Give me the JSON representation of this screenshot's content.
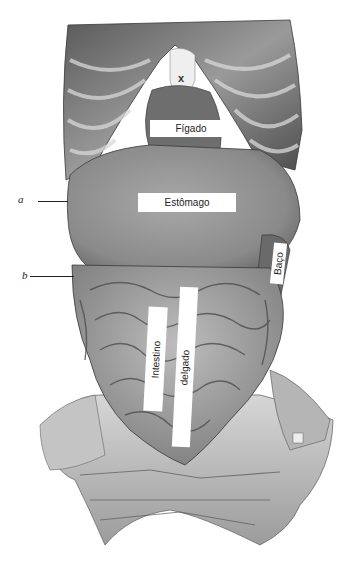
{
  "figure": {
    "style": "grayscale-anatomical-illustration"
  },
  "labels": {
    "figado": "Fígado",
    "estomago": "Estômago",
    "baco": "Baço",
    "intestino": "Intestino",
    "delgado": "delgado"
  },
  "markers": {
    "x": "x",
    "a": "a",
    "b": "b"
  },
  "colors": {
    "background": "#ffffff",
    "label_fill": "#ffffff",
    "text": "#222222",
    "tissue_dark": "#4a4a4a",
    "tissue_mid": "#8a8a8a",
    "tissue_light": "#c8c8c8"
  }
}
